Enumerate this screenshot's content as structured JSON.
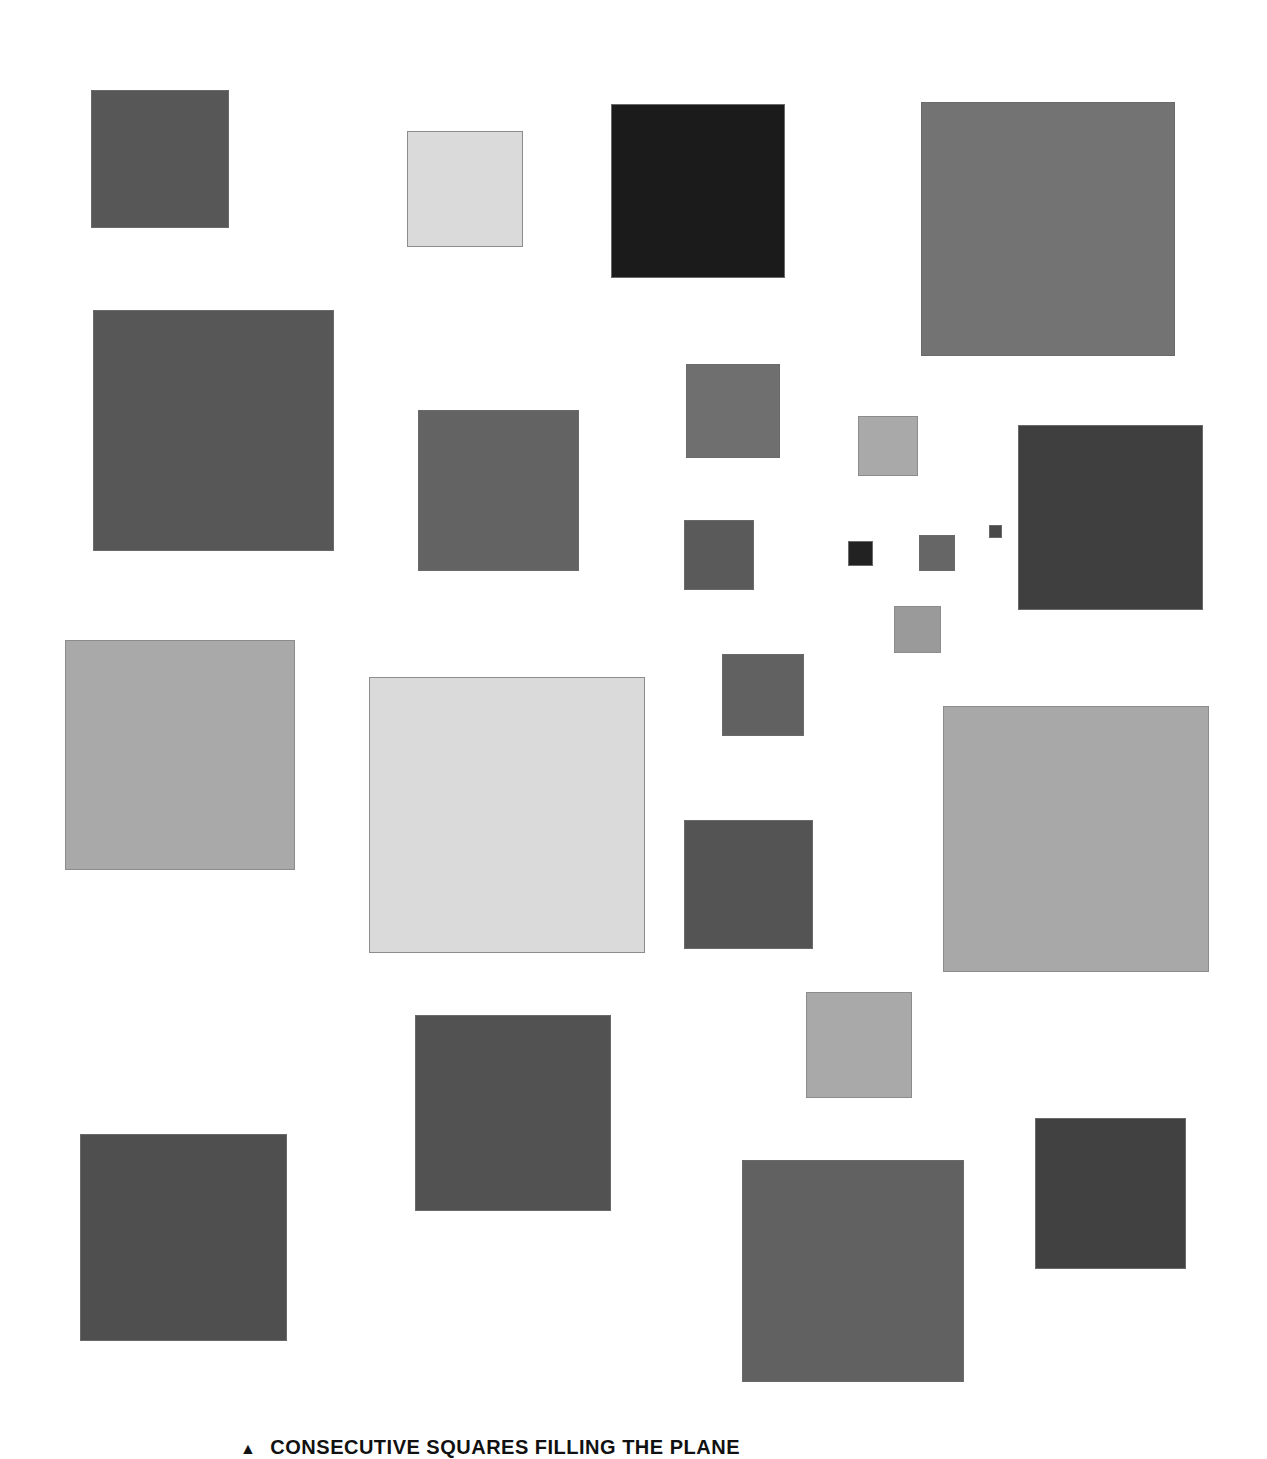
{
  "figure": {
    "caption_marker": "▲",
    "caption": "CONSECUTIVE SQUARES FILLING THE PLANE",
    "background": "#ffffff",
    "squares": [
      {
        "x": 91,
        "y": 90,
        "size": 138,
        "fill": "#575757",
        "tone": "dark"
      },
      {
        "x": 407,
        "y": 131,
        "size": 116,
        "fill": "#dadada",
        "tone": "light"
      },
      {
        "x": 611,
        "y": 104,
        "size": 174,
        "fill": "#1b1b1b",
        "tone": "dark"
      },
      {
        "x": 921,
        "y": 102,
        "size": 254,
        "fill": "#737373",
        "tone": "dark"
      },
      {
        "x": 93,
        "y": 310,
        "size": 241,
        "fill": "#575757",
        "tone": "dark"
      },
      {
        "x": 418,
        "y": 410,
        "size": 161,
        "fill": "#636363",
        "tone": "dark"
      },
      {
        "x": 686,
        "y": 364,
        "size": 94,
        "fill": "#6f6f6f",
        "tone": "dark"
      },
      {
        "x": 858,
        "y": 416,
        "size": 60,
        "fill": "#a9a9a9",
        "tone": "light"
      },
      {
        "x": 1018,
        "y": 425,
        "size": 185,
        "fill": "#3f3f3f",
        "tone": "dark"
      },
      {
        "x": 684,
        "y": 520,
        "size": 70,
        "fill": "#5a5a5a",
        "tone": "dark"
      },
      {
        "x": 848,
        "y": 541,
        "size": 25,
        "fill": "#222222",
        "tone": "dark"
      },
      {
        "x": 919,
        "y": 535,
        "size": 36,
        "fill": "#666666",
        "tone": "dark"
      },
      {
        "x": 989,
        "y": 525,
        "size": 13,
        "fill": "#4a4a4a",
        "tone": "dark"
      },
      {
        "x": 894,
        "y": 606,
        "size": 47,
        "fill": "#9a9a9a",
        "tone": "light"
      },
      {
        "x": 65,
        "y": 640,
        "size": 230,
        "fill": "#a9a9a9",
        "tone": "light"
      },
      {
        "x": 369,
        "y": 677,
        "size": 276,
        "fill": "#dadada",
        "tone": "light"
      },
      {
        "x": 722,
        "y": 654,
        "size": 82,
        "fill": "#616161",
        "tone": "dark"
      },
      {
        "x": 943,
        "y": 706,
        "size": 266,
        "fill": "#a8a8a8",
        "tone": "light"
      },
      {
        "x": 684,
        "y": 820,
        "size": 129,
        "fill": "#545454",
        "tone": "dark"
      },
      {
        "x": 806,
        "y": 992,
        "size": 106,
        "fill": "#a9a9a9",
        "tone": "light"
      },
      {
        "x": 415,
        "y": 1015,
        "size": 196,
        "fill": "#525252",
        "tone": "dark"
      },
      {
        "x": 1035,
        "y": 1118,
        "size": 151,
        "fill": "#414141",
        "tone": "dark"
      },
      {
        "x": 80,
        "y": 1134,
        "size": 207,
        "fill": "#4f4f4f",
        "tone": "dark"
      },
      {
        "x": 742,
        "y": 1160,
        "size": 222,
        "fill": "#616161",
        "tone": "dark"
      }
    ]
  }
}
